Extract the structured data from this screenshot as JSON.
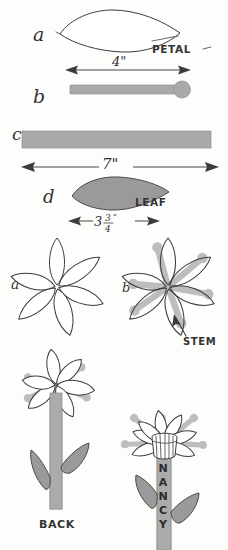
{
  "page": {
    "background_color": "#fdfdfc",
    "ink_color": "#3c3c3c",
    "gray_fill_color": "#a9a9a9",
    "width": 228,
    "height": 550
  },
  "parts": {
    "petal": {
      "step_label": "a",
      "name_label": "PETAL",
      "description": "pointed oval petal outline template"
    },
    "stem_pin": {
      "step_label": "b",
      "dimension": "4\"",
      "description": "gray bar with rounded ball on right end"
    },
    "long_bar": {
      "step_label": "c",
      "dimension": "7\"",
      "description": "long gray rectangular bar"
    },
    "leaf": {
      "step_label": "d",
      "name_label": "LEAF",
      "dimension_whole": "3",
      "dimension_numerator": "3",
      "dimension_denominator": "4",
      "dimension_unit": "\"",
      "dimension_full": "3 3/4\"",
      "description": "solid gray teardrop leaf shape"
    }
  },
  "assembly": {
    "flower_outline": {
      "step_label": "a",
      "description": "six petals arranged in a rosette, outlines only"
    },
    "flower_with_stems": {
      "step_label": "b",
      "callout_label": "STEM",
      "description": "rosette of petals with gray pin stems radiating outward"
    }
  },
  "finished": {
    "back_view": {
      "caption": "BACK",
      "description": "flower on long gray stem with two gray leaves, reverse side"
    },
    "front_view": {
      "personalized_text": "NANCY",
      "description": "finished flower with center cup and personalized stem"
    }
  }
}
